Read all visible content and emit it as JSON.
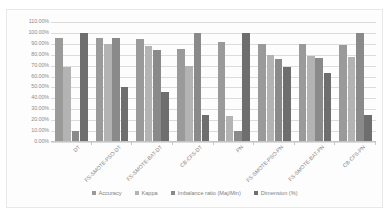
{
  "chart_data": {
    "type": "bar",
    "title": "",
    "subtitle": "",
    "xlabel": "",
    "ylabel": "",
    "ylim": [
      0,
      110
    ],
    "ytick_labels": [
      "110.00%",
      "100.00%",
      "90.00%",
      "80.00%",
      "70.00%",
      "60.00%",
      "50.00%",
      "40.00%",
      "30.00%",
      "20.00%",
      "10.00%",
      "0.00%"
    ],
    "ytick_values": [
      110,
      100,
      90,
      80,
      70,
      60,
      50,
      40,
      30,
      20,
      10,
      0
    ],
    "grid": true,
    "legend_position": "bottom",
    "categories": [
      "DT",
      "FS-SMOTE-PSO-DT",
      "FS-SMOTE-BAT-DT",
      "CB-CFS-DT",
      "PN",
      "FS-SMOTE-PSO-PN",
      "FS-SMOTE-BAT-PN",
      "CB-CFS-PN"
    ],
    "series": [
      {
        "name": "Accuracy",
        "color": "#9a9a9a",
        "values": [
          95.0,
          95.0,
          94.0,
          85.0,
          92.0,
          90.0,
          90.0,
          89.0
        ]
      },
      {
        "name": "Kappa",
        "color": "#b3b3b3",
        "values": [
          69.0,
          90.0,
          88.0,
          70.0,
          24.0,
          80.0,
          79.0,
          78.0
        ]
      },
      {
        "name": "Imbalance ratio (Maj/Min)",
        "color": "#8a8a8a",
        "values": [
          10.0,
          95.0,
          84.0,
          100.0,
          10.0,
          76.0,
          77.0,
          100.0
        ]
      },
      {
        "name": "Dimension (%)",
        "color": "#6e6e6e",
        "values": [
          100.0,
          50.0,
          46.0,
          25.0,
          100.0,
          69.0,
          63.0,
          25.0
        ]
      }
    ]
  },
  "legend": {
    "items": [
      {
        "label": "Accuracy",
        "color": "#9a9a9a"
      },
      {
        "label": "Kappa",
        "color": "#b3b3b3"
      },
      {
        "label": "Imbalance ratio (Maj/Min)",
        "color": "#8a8a8a"
      },
      {
        "label": "Dimension (%)",
        "color": "#6e6e6e"
      }
    ]
  }
}
